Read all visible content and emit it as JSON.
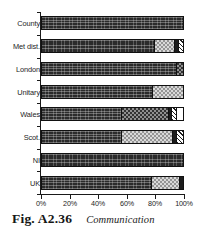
{
  "figure": {
    "caption_number": "Fig. A2.36",
    "caption_title": "Communication"
  },
  "chart_data": {
    "type": "bar",
    "orientation": "horizontal",
    "stacked": true,
    "stacked_normalized": true,
    "title": "Communication",
    "xlabel": "",
    "ylabel": "",
    "xlim": [
      0,
      100
    ],
    "x_tick_labels": [
      "0%",
      "20%",
      "40%",
      "60%",
      "80%",
      "100%"
    ],
    "x_tick_values": [
      0,
      20,
      40,
      60,
      80,
      100
    ],
    "grid": false,
    "legend": "none",
    "categories": [
      "County",
      "Met dist.",
      "London",
      "Unitary",
      "Wales",
      "Scot.",
      "NI",
      "UK"
    ],
    "series": [
      {
        "name": "segment-1",
        "pattern": "dark",
        "values": [
          100,
          80,
          96,
          79,
          57,
          57,
          100,
          78
        ]
      },
      {
        "name": "segment-2",
        "pattern": "light-gray",
        "values": [
          0,
          14,
          4,
          21,
          0,
          36,
          0,
          20
        ]
      },
      {
        "name": "segment-3",
        "pattern": "mid-gray",
        "values": [
          0,
          0,
          0,
          0,
          33,
          0,
          0,
          0
        ]
      },
      {
        "name": "segment-4",
        "pattern": "black",
        "values": [
          0,
          3,
          0,
          0,
          2,
          3,
          0,
          2
        ]
      },
      {
        "name": "segment-5",
        "pattern": "hatch",
        "values": [
          0,
          3,
          0,
          0,
          4,
          4,
          0,
          0
        ]
      },
      {
        "name": "segment-6",
        "pattern": "white",
        "values": [
          0,
          0,
          0,
          0,
          4,
          0,
          0,
          0
        ]
      }
    ],
    "bars": [
      {
        "category": "County",
        "segments": [
          {
            "pattern": "dark",
            "value": 100
          }
        ]
      },
      {
        "category": "Met dist.",
        "segments": [
          {
            "pattern": "dark",
            "value": 80
          },
          {
            "pattern": "light-gray",
            "value": 14
          },
          {
            "pattern": "black",
            "value": 3
          },
          {
            "pattern": "hatch",
            "value": 3
          }
        ]
      },
      {
        "category": "London",
        "segments": [
          {
            "pattern": "dark",
            "value": 96
          },
          {
            "pattern": "mid-gray",
            "value": 4
          }
        ]
      },
      {
        "category": "Unitary",
        "segments": [
          {
            "pattern": "dark",
            "value": 79
          },
          {
            "pattern": "light-gray",
            "value": 21
          }
        ]
      },
      {
        "category": "Wales",
        "segments": [
          {
            "pattern": "dark",
            "value": 57
          },
          {
            "pattern": "mid-gray",
            "value": 33
          },
          {
            "pattern": "black",
            "value": 2
          },
          {
            "pattern": "hatch",
            "value": 4
          },
          {
            "pattern": "white",
            "value": 4
          }
        ]
      },
      {
        "category": "Scot.",
        "segments": [
          {
            "pattern": "dark",
            "value": 57
          },
          {
            "pattern": "light-gray",
            "value": 36
          },
          {
            "pattern": "black",
            "value": 3
          },
          {
            "pattern": "hatch",
            "value": 4
          }
        ]
      },
      {
        "category": "NI",
        "segments": [
          {
            "pattern": "dark",
            "value": 100
          }
        ]
      },
      {
        "category": "UK",
        "segments": [
          {
            "pattern": "dark",
            "value": 78
          },
          {
            "pattern": "light-gray",
            "value": 20
          },
          {
            "pattern": "black",
            "value": 2
          }
        ]
      }
    ],
    "colors": {
      "dark": "#2b2b2b",
      "mid-gray": "#8f8f8f",
      "light-gray": "#d9d9d9",
      "black": "#1c1c1c",
      "hatch": "#ffffff",
      "white": "#ffffff",
      "axis": "#1a1a1a",
      "text": "#242424",
      "background": "#ffffff"
    }
  }
}
